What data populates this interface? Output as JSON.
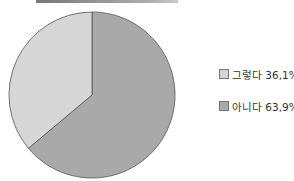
{
  "chart_data": {
    "type": "pie",
    "title": "",
    "categories": [
      "그렇다",
      "아니다"
    ],
    "values": [
      36.1,
      63.9
    ],
    "labels": [
      "그렇다 36,1%",
      "아니다 63,9%"
    ],
    "colors": [
      "#d6d6d6",
      "#a9a9a9"
    ],
    "legend_position": "right"
  },
  "legend": {
    "items": [
      {
        "label": "그렇다 36,1%",
        "color": "#d6d6d6"
      },
      {
        "label": "아니다 63,9%",
        "color": "#a9a9a9"
      }
    ]
  }
}
